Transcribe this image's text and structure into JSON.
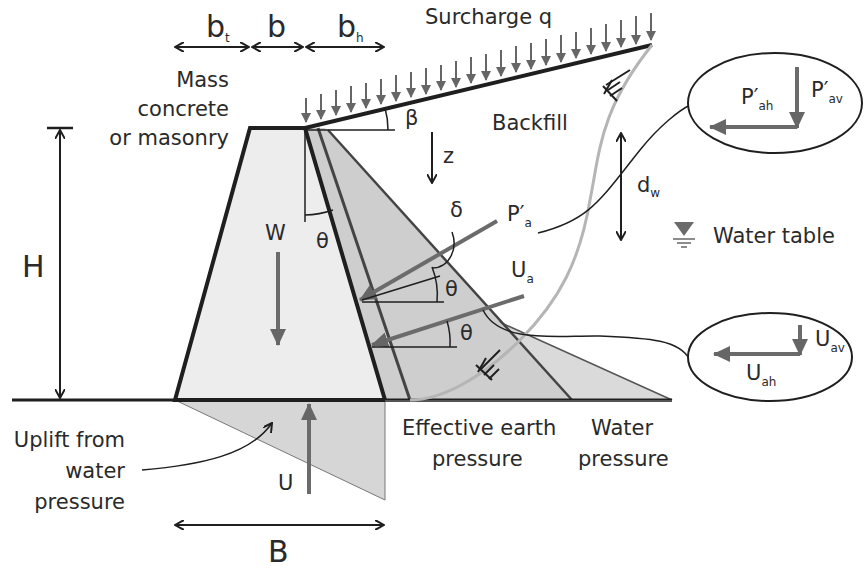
{
  "colors": {
    "line": "#1f1f1f",
    "arrow_gray": "#6b6b6b",
    "wall_fill": "#ececec",
    "earth_fill": "#cfcfcf",
    "water_fill": "#d9d9d9",
    "uplift_fill": "#d6d6d6",
    "curve_gray": "#b5b5b5"
  },
  "dimensions": {
    "bt": {
      "main": "b",
      "sub": "t"
    },
    "b": {
      "main": "b"
    },
    "bh": {
      "main": "b",
      "sub": "h"
    },
    "H": "H",
    "B": "B",
    "dw": {
      "main": "d",
      "sub": "w"
    }
  },
  "labels": {
    "surcharge": "Surcharge q",
    "backfill": "Backfill",
    "wall_material": [
      "Mass",
      "concrete",
      "or masonry"
    ],
    "beta": "β",
    "z": "z",
    "delta": "δ",
    "theta": "θ",
    "W": "W",
    "water_table": "Water table",
    "effective_earth_pressure": [
      "Effective earth",
      "pressure"
    ],
    "water_pressure": [
      "Water",
      "pressure"
    ],
    "uplift": [
      "Uplift from",
      "water",
      "pressure"
    ],
    "U": "U"
  },
  "forces": {
    "Pa": {
      "main": "P′",
      "sub": "a"
    },
    "Ua": {
      "main": "U",
      "sub": "a"
    },
    "Pah": {
      "main": "P′",
      "sub": "ah"
    },
    "Pav": {
      "main": "P′",
      "sub": "av"
    },
    "Uah": {
      "main": "U",
      "sub": "ah"
    },
    "Uav": {
      "main": "U",
      "sub": "av"
    }
  },
  "callouts": {
    "Pa_components": "Horizontal and vertical components of P′a",
    "Ua_components": "Horizontal and vertical components of Ua"
  }
}
